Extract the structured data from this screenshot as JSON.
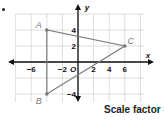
{
  "figure": {
    "axis_labels": {
      "x": "x",
      "y": "y",
      "origin": "O"
    },
    "x_ticks": [
      {
        "value": -6,
        "label": "−6"
      },
      {
        "value": -2,
        "label": "−2"
      },
      {
        "value": 2,
        "label": "2"
      },
      {
        "value": 4,
        "label": "4"
      },
      {
        "value": 6,
        "label": "6"
      }
    ],
    "y_ticks": [
      {
        "value": 4,
        "label": "4"
      },
      {
        "value": 2,
        "label": "2"
      },
      {
        "value": -4,
        "label": "−4"
      }
    ],
    "points": [
      {
        "name": "A",
        "x": -4,
        "y": 4
      },
      {
        "name": "B",
        "x": -4,
        "y": -4
      },
      {
        "name": "C",
        "x": 6,
        "y": 2
      }
    ],
    "polygon": [
      "A",
      "B",
      "C"
    ],
    "scale_factor": {
      "label": "Scale factor =",
      "numerator": "1",
      "denominator": "2"
    },
    "colors": {
      "grid": "#d0d0d0",
      "axis": "#111111",
      "triangle": "#7a7a7a",
      "point_label": "#7a7a7a"
    }
  }
}
